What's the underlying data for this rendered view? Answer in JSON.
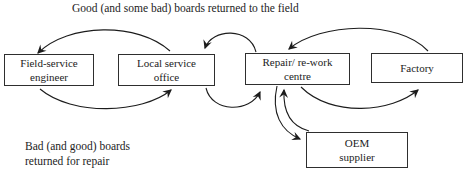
{
  "diagram": {
    "caption_top": "Good (and some bad) boards returned to the field",
    "caption_bottom": {
      "line1": "Bad (and good) boards",
      "line2": "returned for repair"
    },
    "nodes": [
      {
        "id": "field-service-engineer",
        "line1": "Field-service",
        "line2": "engineer"
      },
      {
        "id": "local-service-office",
        "line1": "Local service",
        "line2": "office"
      },
      {
        "id": "repair-rework-centre",
        "line1": "Repair/ re-work",
        "line2": "centre"
      },
      {
        "id": "factory",
        "line1": "Factory",
        "line2": ""
      },
      {
        "id": "oem-supplier",
        "line1": "OEM",
        "line2": "supplier"
      }
    ],
    "edges": [
      {
        "from": "local-service-office",
        "to": "field-service-engineer",
        "side": "top"
      },
      {
        "from": "field-service-engineer",
        "to": "local-service-office",
        "side": "bottom"
      },
      {
        "from": "repair-rework-centre",
        "to": "local-service-office",
        "side": "top"
      },
      {
        "from": "local-service-office",
        "to": "repair-rework-centre",
        "side": "bottom"
      },
      {
        "from": "factory",
        "to": "repair-rework-centre",
        "side": "top"
      },
      {
        "from": "repair-rework-centre",
        "to": "factory",
        "side": "bottom"
      },
      {
        "from": "repair-rework-centre",
        "to": "oem-supplier",
        "side": "bottom"
      },
      {
        "from": "oem-supplier",
        "to": "repair-rework-centre",
        "side": "top"
      }
    ],
    "colors": {
      "background": "#ffffff",
      "stroke": "#1c1c1c",
      "box_border": "#2e2e2e"
    }
  }
}
